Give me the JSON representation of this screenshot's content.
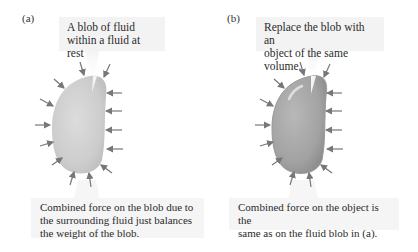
{
  "panel_a": {
    "label": "(a)",
    "callout_lines": [
      "A blob of fluid",
      "within a fluid at rest"
    ],
    "caption_lines": [
      "Combined force on the blob due to",
      "the surrounding fluid just balances",
      "the weight of the blob."
    ],
    "blob_color": "#cfcfcf"
  },
  "panel_b": {
    "label": "(b)",
    "callout_lines": [
      "Replace the blob with an",
      "object of the same volume."
    ],
    "caption_lines": [
      "Combined force on the object is the",
      "same as on the fluid blob in (a)."
    ],
    "object_color": "#a9a9a9"
  },
  "arrow_color": "#777777"
}
